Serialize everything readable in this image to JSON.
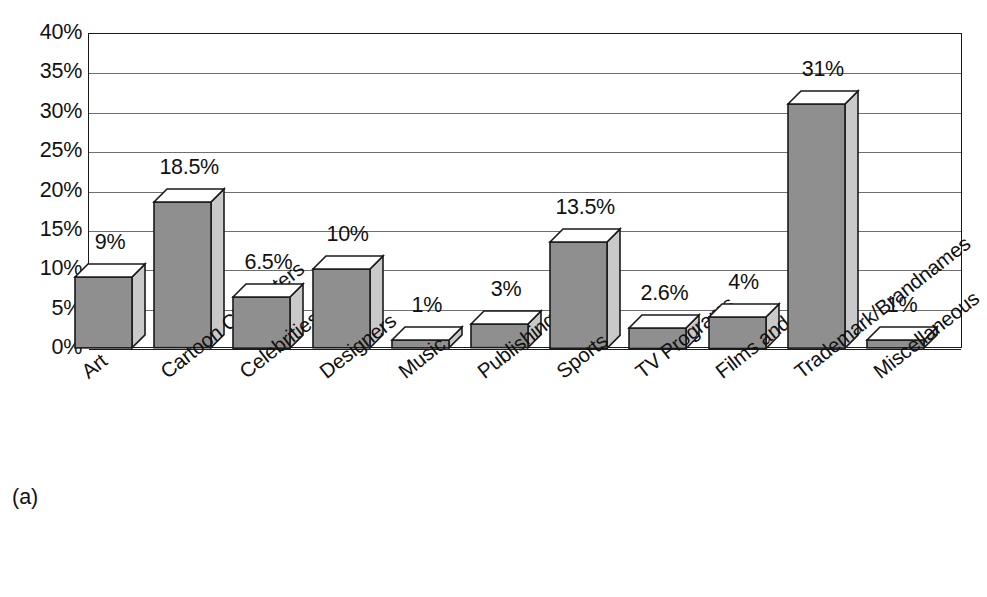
{
  "caption": "(a)",
  "chart_data": {
    "type": "bar",
    "title": "",
    "subtitle": "",
    "xlabel": "",
    "ylabel": "",
    "ylim": [
      0,
      40
    ],
    "ytick_step": 5,
    "ytick_labels": [
      "40%",
      "35%",
      "30%",
      "25%",
      "20%",
      "15%",
      "10%",
      "5%",
      "0%"
    ],
    "ytick_values": [
      40,
      35,
      30,
      25,
      20,
      15,
      10,
      5,
      0
    ],
    "grid": true,
    "legend": null,
    "legend_position": "none",
    "style": "3d-bar",
    "categories": [
      "Art",
      "Cartoon Characters",
      "Celebrities",
      "Designers",
      "Music",
      "Publishing",
      "Sports",
      "TV Programs",
      "Films and Plays",
      "Trademark/Brandnames",
      "Miscellaneous"
    ],
    "values": [
      9,
      18.5,
      6.5,
      10,
      1,
      3,
      13.5,
      2.6,
      4,
      31,
      1
    ],
    "value_labels": [
      "9%",
      "18.5%",
      "6.5%",
      "10%",
      "1%",
      "3%",
      "13.5%",
      "2.6%",
      "4%",
      "31%",
      "1%"
    ],
    "colors": {
      "bar_front": "#8f8f8f",
      "bar_top": "#ffffff",
      "bar_side": "#c9c9c9",
      "outline": "#1a1a1a",
      "gridline": "#6f6f6f",
      "axis": "#1a1a1a",
      "background": "#ffffff",
      "text": "#111111"
    }
  }
}
